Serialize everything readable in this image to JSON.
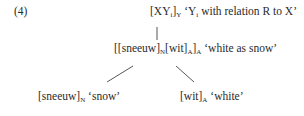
{
  "example": {
    "number": "(4)",
    "root": {
      "schema_open": "[XY",
      "schema_i": "i",
      "schema_close": "]",
      "schema_cat": "Y",
      "gloss_pre": " ‘Y",
      "gloss_i": "i",
      "gloss_post": " with relation R to X’"
    },
    "middle": {
      "p1": "[[sneeuw]",
      "c1": "N",
      "p2": "[wit]",
      "c2": "A",
      "p3": "]",
      "c3": "A",
      "gloss": " ‘white as snow’"
    },
    "left_leaf": {
      "form": "[sneeuw]",
      "cat": "N",
      "gloss": " ‘snow’"
    },
    "right_leaf": {
      "form": "[wit]",
      "cat": "A",
      "gloss": " ‘white’"
    }
  }
}
